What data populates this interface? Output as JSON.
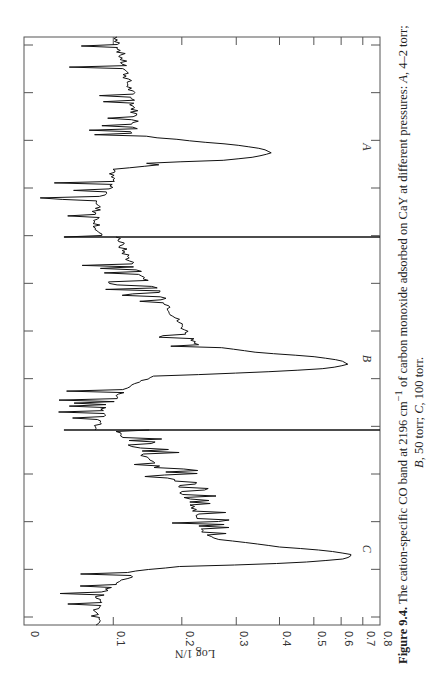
{
  "chart_data": {
    "type": "line",
    "orientation": "rotated-90",
    "title": "",
    "xlabel": "",
    "ylabel": "Log 1/N",
    "ylim": [
      0,
      0.8
    ],
    "y_scale": "transmittance-linear",
    "y_ticks": [
      0,
      0.1,
      0.2,
      0.3,
      0.4,
      0.5,
      0.6,
      0.7,
      0.8
    ],
    "y_tick_labels": [
      "0",
      "0.1",
      "0.2",
      "0.3",
      "0.4",
      "0.5",
      "0.6",
      "0.7",
      "0.8"
    ],
    "x_minor_tick_count": 13,
    "grid": false,
    "legend": "none",
    "series": [
      {
        "name": "A",
        "label": "A",
        "pressure": "4–2 torr",
        "peak_value": 0.38,
        "x": [
          0,
          0.04,
          0.08,
          0.12,
          0.16,
          0.2,
          0.24,
          0.28,
          0.32,
          0.36,
          0.4,
          0.44,
          0.48,
          0.5,
          0.52,
          0.54,
          0.56,
          0.58,
          0.6,
          0.62,
          0.64,
          0.66,
          0.68,
          0.72,
          0.76,
          0.8,
          0.84,
          0.88,
          0.92,
          0.96,
          1.0
        ],
        "values": [
          0.105,
          0.108,
          0.11,
          0.112,
          0.116,
          0.118,
          0.12,
          0.124,
          0.126,
          0.128,
          0.13,
          0.13,
          0.128,
          0.15,
          0.22,
          0.3,
          0.36,
          0.38,
          0.34,
          0.26,
          0.16,
          0.105,
          0.095,
          0.1,
          0.095,
          0.085,
          0.08,
          0.078,
          0.08,
          0.08,
          0.08
        ]
      },
      {
        "name": "B",
        "label": "B",
        "pressure": "50 torr",
        "peak_value": 0.63,
        "x": [
          0,
          0.04,
          0.08,
          0.12,
          0.16,
          0.2,
          0.24,
          0.28,
          0.32,
          0.36,
          0.4,
          0.44,
          0.48,
          0.52,
          0.56,
          0.6,
          0.62,
          0.64,
          0.66,
          0.68,
          0.7,
          0.72,
          0.76,
          0.8,
          0.84,
          0.88,
          0.92,
          0.96,
          1.0
        ],
        "values": [
          0.108,
          0.11,
          0.115,
          0.122,
          0.13,
          0.14,
          0.15,
          0.16,
          0.17,
          0.18,
          0.185,
          0.195,
          0.205,
          0.215,
          0.23,
          0.35,
          0.5,
          0.6,
          0.63,
          0.55,
          0.35,
          0.16,
          0.125,
          0.115,
          0.1,
          0.09,
          0.085,
          0.08,
          0.08
        ]
      },
      {
        "name": "C",
        "label": "C",
        "pressure": "100 torr",
        "peak_value": 0.65,
        "x": [
          0,
          0.04,
          0.08,
          0.12,
          0.16,
          0.2,
          0.24,
          0.28,
          0.32,
          0.36,
          0.4,
          0.44,
          0.48,
          0.52,
          0.56,
          0.6,
          0.62,
          0.64,
          0.66,
          0.68,
          0.7,
          0.72,
          0.76,
          0.8,
          0.84,
          0.88,
          0.92,
          0.96,
          1.0
        ],
        "values": [
          0.105,
          0.11,
          0.125,
          0.14,
          0.15,
          0.165,
          0.18,
          0.19,
          0.2,
          0.21,
          0.22,
          0.225,
          0.23,
          0.235,
          0.26,
          0.4,
          0.55,
          0.65,
          0.62,
          0.45,
          0.2,
          0.125,
          0.12,
          0.1,
          0.085,
          0.08,
          0.078,
          0.078,
          0.078
        ]
      }
    ],
    "annotations": [
      "A",
      "B",
      "C"
    ]
  },
  "figure": {
    "caption_number": "Figure 9.4.",
    "caption_text_1": "The cation-specific CO band at 2196 cm",
    "caption_superscript": "−1",
    "caption_text_2": " of carbon monoxide adsorbed on CaY at different pressures: ",
    "caption_A": "A",
    "caption_A_text": ", 4–2 torr;",
    "caption_B": "B",
    "caption_B_text": ", 50 torr; ",
    "caption_C": "C",
    "caption_C_text": ", 100 torr."
  }
}
